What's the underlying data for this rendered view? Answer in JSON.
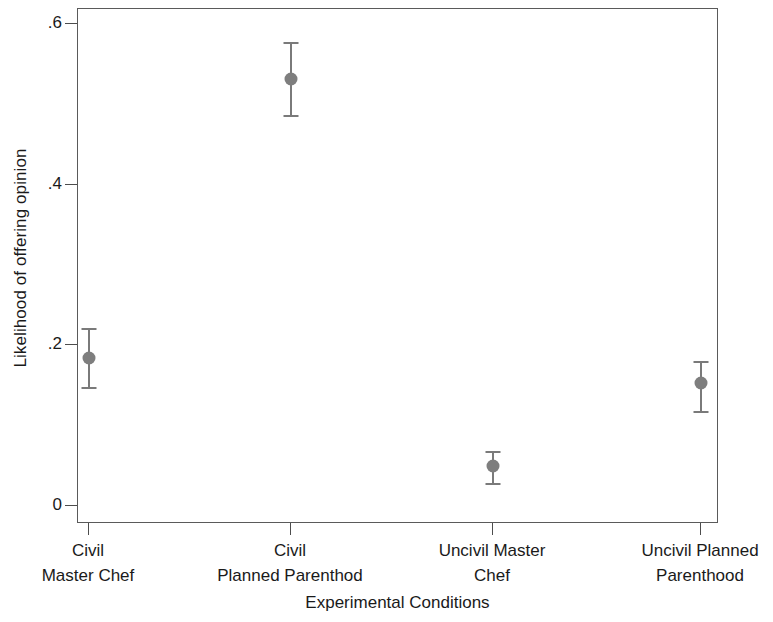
{
  "chart_data": {
    "type": "scatter",
    "title": "",
    "subtitle": "",
    "xlabel": "Experimental Conditions",
    "ylabel": "Likelihood of offering opinion",
    "categories": [
      "Civil\nMaster Chef",
      "Civil\nPlanned Parenthod",
      "Uncivil Master\nChef",
      "Uncivil Planned\nParenthood"
    ],
    "category_lines": [
      [
        "Civil",
        "Master Chef"
      ],
      [
        "Civil",
        "Planned Parenthod"
      ],
      [
        "Uncivil Master",
        "Chef"
      ],
      [
        "Uncivil Planned",
        "Parenthood"
      ]
    ],
    "values": [
      0.184,
      0.532,
      0.05,
      0.153
    ],
    "error_low": [
      0.148,
      0.487,
      0.029,
      0.118
    ],
    "error_high": [
      0.221,
      0.578,
      0.068,
      0.18
    ],
    "ylim": [
      0,
      0.6
    ],
    "ytick_values": [
      0,
      0.2,
      0.4,
      0.6
    ],
    "ytick_labels": [
      "0",
      ".2",
      ".4",
      ".6"
    ],
    "xtick_positions": [
      1,
      2,
      3,
      4
    ],
    "grid": false,
    "legend": null,
    "marker_color": "#7e7e7e",
    "errorbar_color": "#7a7a7a",
    "frame_color": "#5a5a5a",
    "background_color": "#ffffff",
    "text_color": "#1a1a1a"
  }
}
